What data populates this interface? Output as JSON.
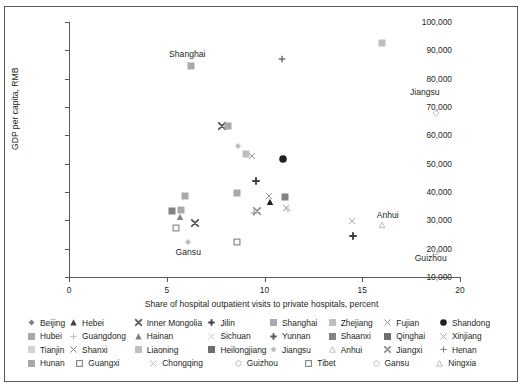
{
  "chart_data": {
    "type": "scatter",
    "title": "",
    "xlabel": "Share of hospital outpatient visits to private hospitals, percent",
    "ylabel": "GDP per capita, RMB",
    "xlim": [
      0,
      20
    ],
    "ylim": [
      10000,
      100000
    ],
    "xticks": [
      0,
      5,
      10,
      15,
      20
    ],
    "xtick_labels": [
      "0",
      "5",
      "10",
      "15",
      "20"
    ],
    "yticks": [
      10000,
      20000,
      30000,
      40000,
      50000,
      60000,
      70000,
      80000,
      90000,
      100000
    ],
    "ytick_labels": [
      "10,000",
      "20,000",
      "30,000",
      "40,000",
      "50,000",
      "60,000",
      "70,000",
      "80,000",
      "90,000",
      "100,000"
    ],
    "grid": false,
    "legend_position": "bottom",
    "annotations": [
      {
        "text": "Shanghai",
        "x": 6.05,
        "y": 88500
      },
      {
        "text": "Jiangsu",
        "x": 18.2,
        "y": 75000
      },
      {
        "text": "Anhui",
        "x": 16.3,
        "y": 31500
      },
      {
        "text": "Guizhou",
        "x": 18.5,
        "y": 16500
      },
      {
        "text": "Gansu",
        "x": 6.1,
        "y": 18500
      }
    ],
    "points": [
      {
        "name": "Shanghai",
        "x": 6.25,
        "y": 84500,
        "marker": "square",
        "color": "#a7a9ac"
      },
      {
        "name": "Zhejiang",
        "x": 16.0,
        "y": 92500,
        "marker": "square",
        "color": "#bcbec0"
      },
      {
        "name": "Tianjin",
        "x": 10.9,
        "y": 86800,
        "marker": "plus",
        "color": "#6d6e71"
      },
      {
        "name": "Jiangsu",
        "x": 18.75,
        "y": 68000,
        "marker": "diamond-open",
        "color": "#bcbec0"
      },
      {
        "name": "Inner Mongolia",
        "x": 7.85,
        "y": 63200,
        "marker": "x-bold",
        "color": "#58595b"
      },
      {
        "name": "Beijing",
        "x": 8.15,
        "y": 63300,
        "marker": "square",
        "color": "#a7a9ac"
      },
      {
        "name": "Guangdong",
        "x": 8.65,
        "y": 56200,
        "marker": "diamond-small",
        "color": "#bcbec0"
      },
      {
        "name": "Fujian",
        "x": 9.35,
        "y": 52600,
        "marker": "x-thin",
        "color": "#939598"
      },
      {
        "name": "Liaoning",
        "x": 9.05,
        "y": 53400,
        "marker": "square",
        "color": "#bcbec0"
      },
      {
        "name": "Shandong",
        "x": 10.95,
        "y": 51500,
        "marker": "circle-filled",
        "color": "#231f20"
      },
      {
        "name": "Jilin",
        "x": 9.55,
        "y": 44000,
        "marker": "plus-bold",
        "color": "#414042"
      },
      {
        "name": "Hubei",
        "x": 8.6,
        "y": 39600,
        "marker": "square",
        "color": "#a7a9ac"
      },
      {
        "name": "Chongqing",
        "x": 5.95,
        "y": 38500,
        "marker": "square",
        "color": "#a7a9ac"
      },
      {
        "name": "Shaanxi",
        "x": 11.05,
        "y": 38400,
        "marker": "square",
        "color": "#808285"
      },
      {
        "name": "Ningxia",
        "x": 5.25,
        "y": 33300,
        "marker": "square",
        "color": "#808285"
      },
      {
        "name": "Hunan",
        "x": 5.75,
        "y": 33600,
        "marker": "square",
        "color": "#a7a9ac"
      },
      {
        "name": "Hainan",
        "x": 5.7,
        "y": 31200,
        "marker": "triangle",
        "color": "#808285"
      },
      {
        "name": "Henan",
        "x": 10.3,
        "y": 36300,
        "marker": "triangle",
        "color": "#231f20"
      },
      {
        "name": "Xinjiang",
        "x": 10.25,
        "y": 38600,
        "marker": "x-thin",
        "color": "#939598"
      },
      {
        "name": "Qinghai",
        "x": 11.1,
        "y": 34300,
        "marker": "x-thin",
        "color": "#a7a9ac"
      },
      {
        "name": "Sichuan",
        "x": 11.2,
        "y": 33500,
        "marker": "plus-thin",
        "color": "#bcbec0"
      },
      {
        "name": "Jiangxi",
        "x": 9.6,
        "y": 33400,
        "marker": "x-bold",
        "color": "#939598"
      },
      {
        "name": "Yunnan",
        "x": 9.45,
        "y": 32600,
        "marker": "plus-thin",
        "color": "#939598"
      },
      {
        "name": "Hebei",
        "x": 14.5,
        "y": 29600,
        "marker": "x-thin",
        "color": "#a7a9ac"
      },
      {
        "name": "Shanxi",
        "x": 6.45,
        "y": 29000,
        "marker": "x-bold",
        "color": "#58595b"
      },
      {
        "name": "Guangxi",
        "x": 5.45,
        "y": 27300,
        "marker": "square-open",
        "color": "#808285"
      },
      {
        "name": "Heilongjiang",
        "x": 14.55,
        "y": 24500,
        "marker": "plus-bold",
        "color": "#414042"
      },
      {
        "name": "Tibet",
        "x": 8.6,
        "y": 22300,
        "marker": "square-open",
        "color": "#808285"
      },
      {
        "name": "Gansu",
        "x": 6.1,
        "y": 22400,
        "marker": "diamond-small",
        "color": "#bcbec0"
      },
      {
        "name": "Anhui",
        "x": 16.0,
        "y": 28200,
        "marker": "triangle-open",
        "color": "#bcbec0"
      },
      {
        "name": "Guizhou",
        "x": 18.75,
        "y": 18800,
        "marker": "circle-open",
        "color": "#bcbec0"
      }
    ]
  },
  "legend": {
    "rows": [
      [
        {
          "label": "Beijing",
          "marker": "diamond-small",
          "color": "#808285"
        },
        {
          "label": "Hebei",
          "marker": "triangle",
          "color": "#414042"
        },
        {
          "label": "Inner Mongolia",
          "marker": "x-bold",
          "color": "#58595b"
        },
        {
          "label": "Jilin",
          "marker": "plus-bold",
          "color": "#414042"
        },
        {
          "label": "Shanghai",
          "marker": "square",
          "color": "#a7a9ac"
        },
        {
          "label": "Zhejiang",
          "marker": "square",
          "color": "#bcbec0"
        },
        {
          "label": "Fujian",
          "marker": "x-thin",
          "color": "#939598"
        },
        {
          "label": "Shandong",
          "marker": "circle-filled",
          "color": "#231f20"
        }
      ],
      [
        {
          "label": "Hubei",
          "marker": "square",
          "color": "#a7a9ac"
        },
        {
          "label": "Guangdong",
          "marker": "plus-thin",
          "color": "#bcbec0"
        },
        {
          "label": "Hainan",
          "marker": "triangle",
          "color": "#808285"
        },
        {
          "label": "Sichuan",
          "marker": "x-thin",
          "color": "#c7c8ca"
        },
        {
          "label": "Yunnan",
          "marker": "plus-bold",
          "color": "#58595b"
        },
        {
          "label": "Shaanxi",
          "marker": "square",
          "color": "#808285"
        },
        {
          "label": "Qinghai",
          "marker": "square",
          "color": "#6d6e71"
        },
        {
          "label": "Xinjiang",
          "marker": "x-thin",
          "color": "#a7a9ac"
        }
      ],
      [
        {
          "label": "Tianjin",
          "marker": "square",
          "color": "#d1d3d4"
        },
        {
          "label": "Shanxi",
          "marker": "x-thin",
          "color": "#808285"
        },
        {
          "label": "Liaoning",
          "marker": "square",
          "color": "#bcbec0"
        },
        {
          "label": "Heilongjiang",
          "marker": "square",
          "color": "#6d6e71"
        },
        {
          "label": "Jiangsu",
          "marker": "diamond-small",
          "color": "#bcbec0"
        },
        {
          "label": "Anhui",
          "marker": "triangle-open",
          "color": "#bcbec0"
        },
        {
          "label": "Jiangxi",
          "marker": "x-bold",
          "color": "#939598"
        },
        {
          "label": "Henan",
          "marker": "plus-thin",
          "color": "#808285"
        }
      ],
      [
        {
          "label": "Hunan",
          "marker": "square",
          "color": "#a7a9ac"
        },
        {
          "label": "Guangxi",
          "marker": "square-open",
          "color": "#808285"
        },
        {
          "label": "Chongqing",
          "marker": "x-thin",
          "color": "#bcbec0"
        },
        {
          "label": "Guizhou",
          "marker": "circle-open",
          "color": "#bcbec0"
        },
        {
          "label": "Tibet",
          "marker": "square-open",
          "color": "#808285"
        },
        {
          "label": "Gansu",
          "marker": "circle-open",
          "color": "#c7c8ca"
        },
        {
          "label": "Ningxia",
          "marker": "triangle-open",
          "color": "#bcbec0"
        }
      ]
    ]
  },
  "colors": {
    "axis": "#58585a",
    "text": "#231f20",
    "frame": "#58585a",
    "background": "#ffffff"
  }
}
